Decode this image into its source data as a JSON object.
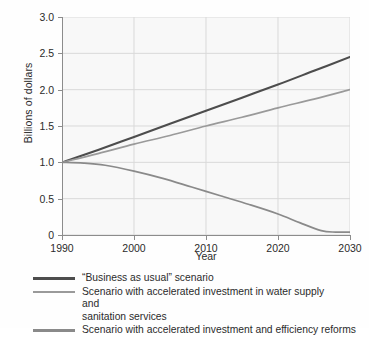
{
  "chart_data": {
    "type": "line",
    "title": "",
    "xlabel": "Year",
    "ylabel": "Billions of dollars",
    "xlim": [
      1990,
      2030
    ],
    "ylim": [
      0,
      3.0
    ],
    "xticks": [
      1990,
      2000,
      2010,
      2020,
      2030
    ],
    "xticklabels": [
      "1990",
      "2000",
      "2010",
      "2020",
      "2030"
    ],
    "yticks": [
      0,
      0.5,
      1.0,
      1.5,
      2.0,
      2.5,
      3.0
    ],
    "yticklabels": [
      "0",
      "0.5",
      "1.0",
      "1.5",
      "2.0",
      "2.5",
      "3.0"
    ],
    "grid": true,
    "legend_position": "below",
    "series": [
      {
        "name": "“Business as usual” scenario",
        "color": "#4d4d4d",
        "x": [
          1990,
          1995,
          2000,
          2005,
          2010,
          2015,
          2020,
          2025,
          2030
        ],
        "values": [
          1.0,
          1.17,
          1.35,
          1.53,
          1.71,
          1.89,
          2.07,
          2.26,
          2.45
        ]
      },
      {
        "name": "Scenario with accelerated investment in water supply and sanitation services",
        "color": "#9a9a9a",
        "x": [
          1990,
          1995,
          2000,
          2005,
          2010,
          2015,
          2020,
          2025,
          2030
        ],
        "values": [
          1.0,
          1.12,
          1.25,
          1.37,
          1.5,
          1.62,
          1.75,
          1.87,
          2.0
        ]
      },
      {
        "name": "Scenario with accelerated investment and efficiency reforms",
        "color": "#8a8a8a",
        "x": [
          1990,
          1993,
          1996,
          2000,
          2004,
          2008,
          2012,
          2016,
          2020,
          2023,
          2026,
          2028,
          2030
        ],
        "values": [
          1.0,
          0.99,
          0.96,
          0.88,
          0.78,
          0.66,
          0.54,
          0.42,
          0.29,
          0.17,
          0.06,
          0.04,
          0.04
        ]
      }
    ]
  },
  "legend": {
    "items": [
      {
        "label": "“Business as usual” scenario",
        "color": "#4d4d4d",
        "wrapped": false
      },
      {
        "label": "Scenario with accelerated investment in water supply and\n      sanitation services",
        "color": "#9a9a9a",
        "wrapped": true
      },
      {
        "label": "Scenario with accelerated investment and efficiency reforms",
        "color": "#8a8a8a",
        "wrapped": false
      }
    ]
  },
  "colors": {
    "plot_background": "#f8f8f8",
    "grid": "#d9d9d9",
    "axis": "#8c8c8c",
    "text": "#2b2b2b"
  }
}
